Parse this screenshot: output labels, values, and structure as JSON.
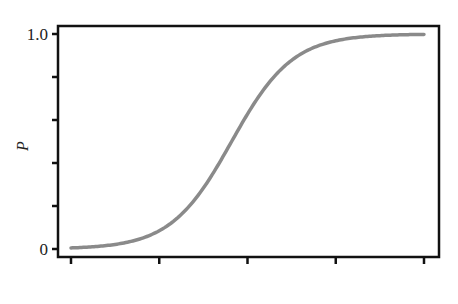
{
  "chart_data": {
    "type": "line",
    "title": "",
    "xlabel": "",
    "ylabel": "P",
    "xlim": [
      0,
      4
    ],
    "ylim": [
      0,
      1
    ],
    "x_ticks": [
      0,
      1,
      2,
      3,
      4
    ],
    "x_tick_labels": [
      "",
      "",
      "",
      "",
      ""
    ],
    "y_ticks": [
      0,
      0.2,
      0.4,
      0.6,
      0.8,
      1.0
    ],
    "y_tick_labels": [
      "0",
      "",
      "",
      "",
      "",
      "1.0"
    ],
    "grid": false,
    "legend": null,
    "series": [
      {
        "name": "P",
        "color": "#8a8a8a",
        "x": [
          0,
          0.25,
          0.5,
          0.75,
          1.0,
          1.25,
          1.5,
          1.75,
          2.0,
          2.25,
          2.5,
          2.75,
          3.0,
          3.25,
          3.5,
          3.75,
          4.0
        ],
        "values": [
          0.01,
          0.02,
          0.04,
          0.08,
          0.14,
          0.25,
          0.39,
          0.53,
          0.68,
          0.8,
          0.88,
          0.93,
          0.96,
          0.975,
          0.985,
          0.99,
          0.995
        ]
      }
    ]
  }
}
